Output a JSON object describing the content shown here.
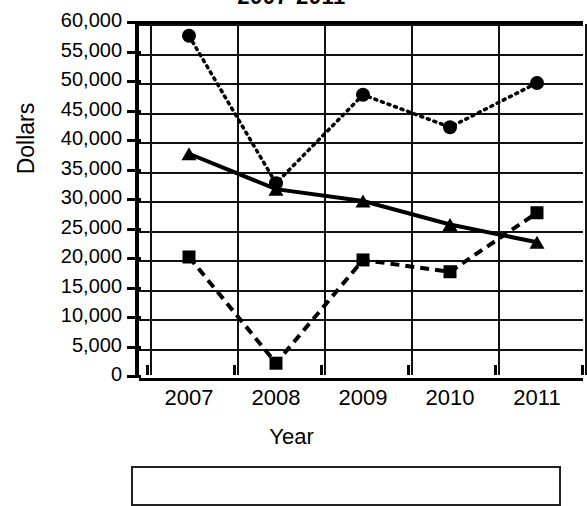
{
  "chart_data": {
    "type": "line",
    "title": "2007-2011",
    "xlabel": "Year",
    "ylabel": "Dollars",
    "categories": [
      "2007",
      "2008",
      "2009",
      "2010",
      "2011"
    ],
    "x": [
      2007,
      2008,
      2009,
      2010,
      2011
    ],
    "ylim": [
      0,
      60000
    ],
    "yticks": [
      0,
      5000,
      10000,
      15000,
      20000,
      25000,
      30000,
      35000,
      40000,
      45000,
      50000,
      55000,
      60000
    ],
    "ytick_labels": [
      "0",
      "5,000",
      "10,000",
      "15,000",
      "20,000",
      "25,000",
      "30,000",
      "35,000",
      "40,000",
      "45,000",
      "50,000",
      "55,000",
      "60,000"
    ],
    "grid": "horizontal-and-vertical",
    "legend_position": "below-plot",
    "legend_entries": [],
    "series": [
      {
        "name": "circle-series",
        "marker": "circle",
        "line_style": "dotted",
        "color": "#000000",
        "values": [
          57500,
          32500,
          47500,
          42000,
          49500
        ]
      },
      {
        "name": "triangle-series",
        "marker": "triangle",
        "line_style": "solid",
        "color": "#000000",
        "values": [
          37500,
          31500,
          29500,
          25500,
          22500
        ]
      },
      {
        "name": "square-series",
        "marker": "square",
        "line_style": "dashed",
        "color": "#000000",
        "values": [
          20000,
          2000,
          19500,
          17500,
          27500
        ]
      }
    ]
  },
  "axes": {
    "y_axis_title": "Dollars",
    "x_axis_title": "Year"
  },
  "title": "2007-2011"
}
